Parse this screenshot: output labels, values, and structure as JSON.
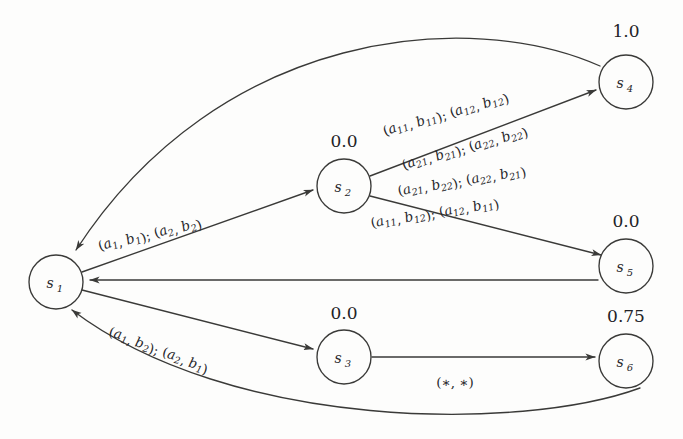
{
  "diagram": {
    "type": "state-transition-diagram",
    "stroke_color": "#3a3a38",
    "text_color": "#26262a",
    "background": "#fdfdfc",
    "nodes": [
      {
        "id": "s1",
        "base": "s",
        "sub": "1",
        "value": "",
        "cx": 56,
        "cy": 282,
        "r": 27
      },
      {
        "id": "s2",
        "base": "s",
        "sub": "2",
        "value": "0.0",
        "cx": 344,
        "cy": 186,
        "r": 27
      },
      {
        "id": "s3",
        "base": "s",
        "sub": "3",
        "value": "0.0",
        "cx": 344,
        "cy": 357,
        "r": 27
      },
      {
        "id": "s4",
        "base": "s",
        "sub": "4",
        "value": "1.0",
        "cx": 626,
        "cy": 82,
        "r": 27
      },
      {
        "id": "s5",
        "base": "s",
        "sub": "5",
        "value": "0.0",
        "cx": 626,
        "cy": 266,
        "r": 27
      },
      {
        "id": "s6",
        "base": "s",
        "sub": "6",
        "value": "0.75",
        "cx": 626,
        "cy": 361,
        "r": 27
      }
    ],
    "edges": [
      {
        "id": "e-s1-s2",
        "from": "s1",
        "to": "s2",
        "labels": [
          {
            "id": "l-s1-s2",
            "parts": [
              {
                "t": "(",
                "k": "p"
              },
              {
                "t": "a",
                "k": "i"
              },
              {
                "t": "1",
                "k": "s"
              },
              {
                "t": ", ",
                "k": "p"
              },
              {
                "t": "b",
                "k": "i"
              },
              {
                "t": "1",
                "k": "s"
              },
              {
                "t": "); (",
                "k": "p"
              },
              {
                "t": "a",
                "k": "i"
              },
              {
                "t": "2",
                "k": "s"
              },
              {
                "t": ", ",
                "k": "p"
              },
              {
                "t": "b",
                "k": "i"
              },
              {
                "t": "2",
                "k": "s"
              },
              {
                "t": ")",
                "k": "p"
              }
            ]
          }
        ]
      },
      {
        "id": "e-s1-s3",
        "from": "s1",
        "to": "s3",
        "labels": [
          {
            "id": "l-s1-s3",
            "parts": [
              {
                "t": "(",
                "k": "p"
              },
              {
                "t": "a",
                "k": "i"
              },
              {
                "t": "1",
                "k": "s"
              },
              {
                "t": ", ",
                "k": "p"
              },
              {
                "t": "b",
                "k": "i"
              },
              {
                "t": "2",
                "k": "s"
              },
              {
                "t": "); (",
                "k": "p"
              },
              {
                "t": "a",
                "k": "i"
              },
              {
                "t": "2",
                "k": "s"
              },
              {
                "t": ", ",
                "k": "p"
              },
              {
                "t": "b",
                "k": "i"
              },
              {
                "t": "1",
                "k": "s"
              },
              {
                "t": ")",
                "k": "p"
              }
            ]
          }
        ]
      },
      {
        "id": "e-s2-s4",
        "from": "s2",
        "to": "s4",
        "labels": [
          {
            "id": "l-s2-s4-a",
            "parts": [
              {
                "t": "(",
                "k": "p"
              },
              {
                "t": "a",
                "k": "i"
              },
              {
                "t": "11",
                "k": "s"
              },
              {
                "t": ", ",
                "k": "p"
              },
              {
                "t": "b",
                "k": "i"
              },
              {
                "t": "11",
                "k": "s"
              },
              {
                "t": "); (",
                "k": "p"
              },
              {
                "t": "a",
                "k": "i"
              },
              {
                "t": "12",
                "k": "s"
              },
              {
                "t": ", ",
                "k": "p"
              },
              {
                "t": "b",
                "k": "i"
              },
              {
                "t": "12",
                "k": "s"
              },
              {
                "t": ")",
                "k": "p"
              }
            ]
          },
          {
            "id": "l-s2-s4-b",
            "parts": [
              {
                "t": "(",
                "k": "p"
              },
              {
                "t": "a",
                "k": "i"
              },
              {
                "t": "21",
                "k": "s"
              },
              {
                "t": ", ",
                "k": "p"
              },
              {
                "t": "b",
                "k": "i"
              },
              {
                "t": "21",
                "k": "s"
              },
              {
                "t": "); (",
                "k": "p"
              },
              {
                "t": "a",
                "k": "i"
              },
              {
                "t": "22",
                "k": "s"
              },
              {
                "t": ", ",
                "k": "p"
              },
              {
                "t": "b",
                "k": "i"
              },
              {
                "t": "22",
                "k": "s"
              },
              {
                "t": ")",
                "k": "p"
              }
            ]
          }
        ]
      },
      {
        "id": "e-s2-s5",
        "from": "s2",
        "to": "s5",
        "labels": [
          {
            "id": "l-s2-s5-a",
            "parts": [
              {
                "t": "(",
                "k": "p"
              },
              {
                "t": "a",
                "k": "i"
              },
              {
                "t": "21",
                "k": "s"
              },
              {
                "t": ", ",
                "k": "p"
              },
              {
                "t": "b",
                "k": "i"
              },
              {
                "t": "22",
                "k": "s"
              },
              {
                "t": "); (",
                "k": "p"
              },
              {
                "t": "a",
                "k": "i"
              },
              {
                "t": "22",
                "k": "s"
              },
              {
                "t": ", ",
                "k": "p"
              },
              {
                "t": "b",
                "k": "i"
              },
              {
                "t": "21",
                "k": "s"
              },
              {
                "t": ")",
                "k": "p"
              }
            ]
          },
          {
            "id": "l-s2-s5-b",
            "parts": [
              {
                "t": "(",
                "k": "p"
              },
              {
                "t": "a",
                "k": "i"
              },
              {
                "t": "11",
                "k": "s"
              },
              {
                "t": ", ",
                "k": "p"
              },
              {
                "t": "b",
                "k": "i"
              },
              {
                "t": "12",
                "k": "s"
              },
              {
                "t": "); (",
                "k": "p"
              },
              {
                "t": "a",
                "k": "i"
              },
              {
                "t": "12",
                "k": "s"
              },
              {
                "t": ", ",
                "k": "p"
              },
              {
                "t": "b",
                "k": "i"
              },
              {
                "t": "11",
                "k": "s"
              },
              {
                "t": ")",
                "k": "p"
              }
            ]
          }
        ]
      },
      {
        "id": "e-s3-s6",
        "from": "s3",
        "to": "s6",
        "labels": [
          {
            "id": "l-s3-s6",
            "parts": [
              {
                "t": "(∗, ∗)",
                "k": "p"
              }
            ]
          }
        ]
      },
      {
        "id": "e-s4-s1",
        "from": "s4",
        "to": "s1",
        "labels": []
      },
      {
        "id": "e-s5-s1",
        "from": "s5",
        "to": "s1",
        "labels": []
      },
      {
        "id": "e-s6-s1",
        "from": "s6",
        "to": "s1",
        "labels": []
      }
    ]
  }
}
